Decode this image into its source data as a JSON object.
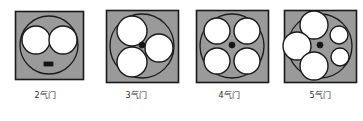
{
  "figure": {
    "background_color": "#ffffff",
    "panel_count": 4
  },
  "style": {
    "square_fill": "#9a9a9a",
    "square_stroke": "#1a1a1a",
    "circle_fill": "#ffffff",
    "circle_stroke": "#1a1a1a",
    "marker_fill": "#141414",
    "caption_color": "#2b2b2b"
  },
  "panels": [
    {
      "id": "panel-2-valve",
      "caption": "2气门",
      "valve_count": 2,
      "square": {
        "x": 15,
        "y": 11,
        "size": 68
      },
      "bore_circle": {
        "cx": 49,
        "cy": 45,
        "r": 29
      },
      "valves": [
        {
          "cx": 36,
          "cy": 40,
          "r": 14,
          "size_class": "large"
        },
        {
          "cx": 63,
          "cy": 40,
          "r": 14,
          "size_class": "large"
        }
      ],
      "center_marker": null,
      "spark_plug": {
        "type": "rect",
        "x": 44,
        "y": 62,
        "w": 9,
        "h": 4
      }
    },
    {
      "id": "panel-3-valve",
      "caption": "3气门",
      "valve_count": 3,
      "square": {
        "x": 15,
        "y": 10,
        "size": 72
      },
      "bore_circle": {
        "cx": 51,
        "cy": 46,
        "r": 32
      },
      "valves": [
        {
          "cx": 41,
          "cy": 31,
          "r": 15,
          "size_class": "large"
        },
        {
          "cx": 41,
          "cy": 62,
          "r": 15,
          "size_class": "large"
        },
        {
          "cx": 68,
          "cy": 48,
          "r": 14,
          "size_class": "large"
        }
      ],
      "center_marker": {
        "cx": 51,
        "cy": 45,
        "r": 3
      },
      "spark_plug": null
    },
    {
      "id": "panel-4-valve",
      "caption": "4气门",
      "valve_count": 4,
      "square": {
        "x": 12,
        "y": 10,
        "size": 72
      },
      "bore_circle": {
        "cx": 48,
        "cy": 46,
        "r": 32
      },
      "valves": [
        {
          "cx": 33,
          "cy": 31,
          "r": 13,
          "size_class": "large"
        },
        {
          "cx": 63,
          "cy": 31,
          "r": 13,
          "size_class": "large"
        },
        {
          "cx": 33,
          "cy": 61,
          "r": 13,
          "size_class": "large"
        },
        {
          "cx": 63,
          "cy": 61,
          "r": 13,
          "size_class": "large"
        }
      ],
      "center_marker": {
        "cx": 48,
        "cy": 45,
        "r": 3
      },
      "spark_plug": null
    },
    {
      "id": "panel-5-valve",
      "caption": "5气门",
      "valve_count": 5,
      "square": {
        "x": 9,
        "y": 10,
        "size": 72
      },
      "bore_circle": {
        "cx": 45,
        "cy": 46,
        "r": 32
      },
      "valves": [
        {
          "cx": 39,
          "cy": 25,
          "r": 14,
          "size_class": "large"
        },
        {
          "cx": 39,
          "cy": 66,
          "r": 14,
          "size_class": "large"
        },
        {
          "cx": 22,
          "cy": 46,
          "r": 14,
          "size_class": "large"
        },
        {
          "cx": 64,
          "cy": 35,
          "r": 9,
          "size_class": "small"
        },
        {
          "cx": 65,
          "cy": 57,
          "r": 9,
          "size_class": "small"
        }
      ],
      "center_marker": {
        "cx": 45,
        "cy": 45,
        "r": 3
      },
      "spark_plug": null
    }
  ]
}
